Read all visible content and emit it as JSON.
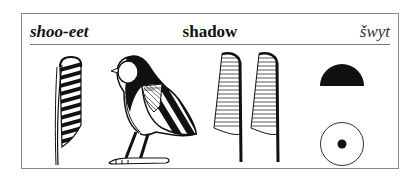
{
  "card": {
    "transliteration_pronunciation": "shoo-eet",
    "meaning": "shadow",
    "transliteration_egyptological": "šwyt"
  },
  "glyphs": [
    {
      "name": "feather-striped",
      "description": "single tall feather with black diagonal stripes"
    },
    {
      "name": "quail-chick",
      "description": "seated bird with striped wing"
    },
    {
      "name": "feather-hatched-1",
      "description": "feather with fine horizontal hatching"
    },
    {
      "name": "feather-hatched-2",
      "description": "feather with fine horizontal hatching"
    },
    {
      "name": "bread-loaf",
      "description": "solid black half-circle"
    },
    {
      "name": "sun-disk",
      "description": "outlined circle with central dot"
    }
  ],
  "colors": {
    "ink": "#111111",
    "frame": "#8a8a8a",
    "background": "#ffffff"
  }
}
